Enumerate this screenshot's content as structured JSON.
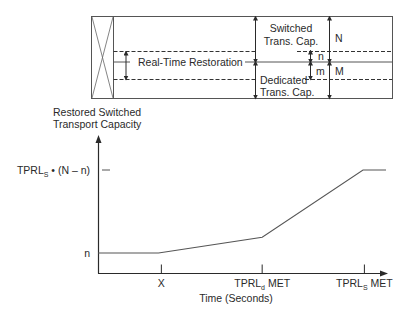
{
  "top_diagram": {
    "real_time_restoration": "Real-Time Restoration",
    "switched_line1": "Switched",
    "switched_line2": "Trans. Cap.",
    "dedicated_line1": "Dedicated",
    "dedicated_line2": "Trans. Cap.",
    "label_N": "N",
    "label_n": "n",
    "label_m": "m",
    "label_M": "M"
  },
  "chart_data": {
    "type": "line",
    "title": "",
    "ylabel_line1": "Restored Switched",
    "ylabel_line2": "Transport Capacity",
    "xlabel": "Time (Seconds)",
    "y_ticks": [
      {
        "label_main": "TPRL",
        "label_sub": "S",
        "label_rest": " • (N – n)",
        "level": 1.0
      },
      {
        "label_main": "n",
        "label_sub": "",
        "label_rest": "",
        "level": 0.0
      }
    ],
    "x_ticks": [
      {
        "label_main": "X",
        "label_sub": "",
        "label_rest": "",
        "position": 0.22
      },
      {
        "label_main": "TPRL",
        "label_sub": "d",
        "label_rest": " MET",
        "position": 0.57
      },
      {
        "label_main": "TPRL",
        "label_sub": "S",
        "label_rest": " MET",
        "position": 0.925
      }
    ],
    "series": [
      {
        "name": "Restored Switched Transport Capacity",
        "points": [
          [
            0.0,
            0.0
          ],
          [
            0.21,
            0.0
          ],
          [
            0.57,
            0.19
          ],
          [
            0.92,
            1.0
          ],
          [
            1.0,
            1.0
          ]
        ]
      }
    ],
    "x_range": [
      0,
      1
    ],
    "y_range": [
      0,
      1
    ],
    "grid": false
  }
}
